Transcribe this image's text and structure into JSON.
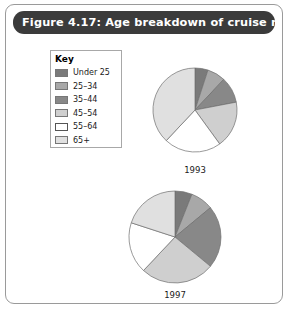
{
  "figure": {
    "title": "Figure 4.17: Age breakdown of cruise markets",
    "banner_color": "#3b3b3b",
    "border_color": "#9a9a9a"
  },
  "legend": {
    "title": "Key",
    "items": [
      {
        "label": "Under 25",
        "color": "#7a7a7a"
      },
      {
        "label": "25–34",
        "color": "#a8a8a8"
      },
      {
        "label": "35–44",
        "color": "#888888"
      },
      {
        "label": "45–54",
        "color": "#cfcfcf"
      },
      {
        "label": "55–64",
        "color": "#ffffff"
      },
      {
        "label": "65+",
        "color": "#e0e0e0"
      }
    ]
  },
  "chart_data": {
    "type": "pie",
    "title": "Figure 4.17: Age breakdown of cruise markets",
    "categories": [
      "Under 25",
      "25–34",
      "35–44",
      "45–54",
      "55–64",
      "65+"
    ],
    "colors": [
      "#7a7a7a",
      "#a8a8a8",
      "#888888",
      "#cfcfcf",
      "#ffffff",
      "#e0e0e0"
    ],
    "legend_position": "top-left",
    "charts": [
      {
        "name": "1993",
        "label": "1993",
        "values": [
          5,
          7,
          10,
          18,
          22,
          38
        ]
      },
      {
        "name": "1997",
        "label": "1997",
        "values": [
          6,
          8,
          22,
          26,
          18,
          20
        ]
      }
    ]
  },
  "captions": {
    "pie1": "1993",
    "pie2": "1997"
  }
}
